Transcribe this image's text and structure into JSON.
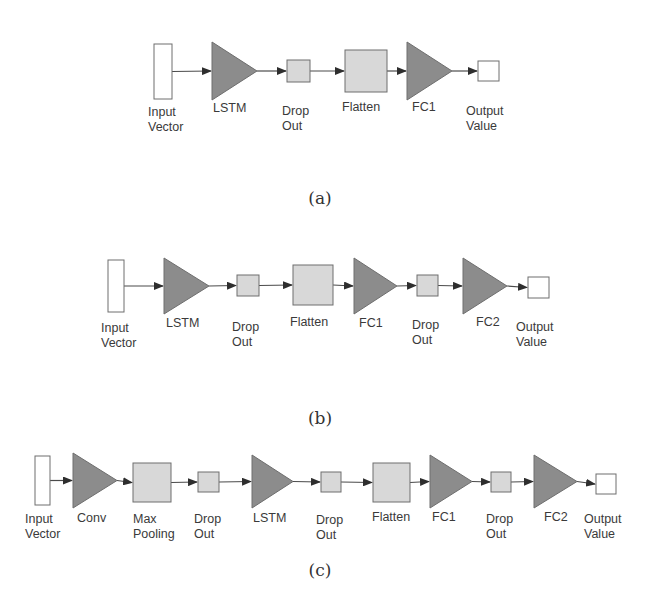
{
  "colors": {
    "triangle_fill": "#8c8c8c",
    "triangle_stroke": "#6e6e6e",
    "box_fill": "#d8d8d8",
    "box_stroke": "#6e6e6e",
    "io_fill": "#ffffff",
    "io_stroke": "#6e6e6e",
    "edge": "#4a4a4a",
    "label": "#3a3a3a"
  },
  "diagrams": [
    {
      "id": "a",
      "caption": "(a)",
      "caption_pos": [
        320,
        188
      ],
      "nodes": [
        {
          "kind": "io",
          "label": [
            "Input",
            "Vector"
          ],
          "x": 154,
          "y": 44,
          "w": 18,
          "h": 55,
          "lx": 148,
          "ly": 105
        },
        {
          "kind": "triangle",
          "label": [
            "LSTM"
          ],
          "x": 212,
          "y": 42,
          "w": 45,
          "h": 58,
          "lx": 213,
          "ly": 101
        },
        {
          "kind": "box",
          "label": [
            "Drop",
            "Out"
          ],
          "x": 287,
          "y": 60,
          "w": 23,
          "h": 22,
          "lx": 282,
          "ly": 104
        },
        {
          "kind": "box",
          "label": [
            "Flatten"
          ],
          "x": 345,
          "y": 50,
          "w": 42,
          "h": 42,
          "lx": 342,
          "ly": 100
        },
        {
          "kind": "triangle",
          "label": [
            "FC1"
          ],
          "x": 407,
          "y": 42,
          "w": 45,
          "h": 58,
          "lx": 412,
          "ly": 100
        },
        {
          "kind": "io",
          "label": [
            "Output",
            "Value"
          ],
          "x": 478,
          "y": 61,
          "w": 21,
          "h": 20,
          "lx": 466,
          "ly": 104
        }
      ]
    },
    {
      "id": "b",
      "caption": "(b)",
      "caption_pos": [
        320,
        408
      ],
      "nodes": [
        {
          "kind": "io",
          "label": [
            "Input",
            "Vector"
          ],
          "x": 108,
          "y": 260,
          "w": 16,
          "h": 52,
          "lx": 101,
          "ly": 321
        },
        {
          "kind": "triangle",
          "label": [
            "LSTM"
          ],
          "x": 164,
          "y": 258,
          "w": 45,
          "h": 56,
          "lx": 166,
          "ly": 316
        },
        {
          "kind": "box",
          "label": [
            "Drop",
            "Out"
          ],
          "x": 237,
          "y": 275,
          "w": 22,
          "h": 21,
          "lx": 232,
          "ly": 320
        },
        {
          "kind": "box",
          "label": [
            "Flatten"
          ],
          "x": 293,
          "y": 265,
          "w": 40,
          "h": 40,
          "lx": 290,
          "ly": 315
        },
        {
          "kind": "triangle",
          "label": [
            "FC1"
          ],
          "x": 354,
          "y": 258,
          "w": 43,
          "h": 56,
          "lx": 359,
          "ly": 316
        },
        {
          "kind": "box",
          "label": [
            "Drop",
            "Out"
          ],
          "x": 417,
          "y": 275,
          "w": 21,
          "h": 21,
          "lx": 412,
          "ly": 318
        },
        {
          "kind": "triangle",
          "label": [
            "FC2"
          ],
          "x": 463,
          "y": 258,
          "w": 44,
          "h": 56,
          "lx": 476,
          "ly": 315
        },
        {
          "kind": "io",
          "label": [
            "Output",
            "Value"
          ],
          "x": 528,
          "y": 277,
          "w": 21,
          "h": 21,
          "lx": 516,
          "ly": 320
        }
      ]
    },
    {
      "id": "c",
      "caption": "(c)",
      "caption_pos": [
        320,
        560
      ],
      "nodes": [
        {
          "kind": "io",
          "label": [
            "Input",
            "Vector"
          ],
          "x": 35,
          "y": 456,
          "w": 15,
          "h": 49,
          "lx": 25,
          "ly": 512
        },
        {
          "kind": "triangle",
          "label": [
            "Conv"
          ],
          "x": 73,
          "y": 453,
          "w": 44,
          "h": 55,
          "lx": 77,
          "ly": 511
        },
        {
          "kind": "box",
          "label": [
            "Max",
            "Pooling"
          ],
          "x": 133,
          "y": 463,
          "w": 38,
          "h": 39,
          "lx": 133,
          "ly": 512
        },
        {
          "kind": "box",
          "label": [
            "Drop",
            "Out"
          ],
          "x": 198,
          "y": 472,
          "w": 21,
          "h": 20,
          "lx": 194,
          "ly": 512
        },
        {
          "kind": "triangle",
          "label": [
            "LSTM"
          ],
          "x": 252,
          "y": 455,
          "w": 41,
          "h": 53,
          "lx": 253,
          "ly": 511
        },
        {
          "kind": "box",
          "label": [
            "Drop",
            "Out"
          ],
          "x": 321,
          "y": 472,
          "w": 20,
          "h": 20,
          "lx": 316,
          "ly": 513
        },
        {
          "kind": "box",
          "label": [
            "Flatten"
          ],
          "x": 373,
          "y": 463,
          "w": 37,
          "h": 39,
          "lx": 372,
          "ly": 510
        },
        {
          "kind": "triangle",
          "label": [
            "FC1"
          ],
          "x": 430,
          "y": 455,
          "w": 42,
          "h": 53,
          "lx": 432,
          "ly": 510
        },
        {
          "kind": "box",
          "label": [
            "Drop",
            "Out"
          ],
          "x": 491,
          "y": 472,
          "w": 20,
          "h": 20,
          "lx": 486,
          "ly": 512
        },
        {
          "kind": "triangle",
          "label": [
            "FC2"
          ],
          "x": 534,
          "y": 455,
          "w": 43,
          "h": 53,
          "lx": 544,
          "ly": 510
        },
        {
          "kind": "io",
          "label": [
            "Output",
            "Value"
          ],
          "x": 596,
          "y": 474,
          "w": 20,
          "h": 20,
          "lx": 584,
          "ly": 512
        }
      ]
    }
  ]
}
